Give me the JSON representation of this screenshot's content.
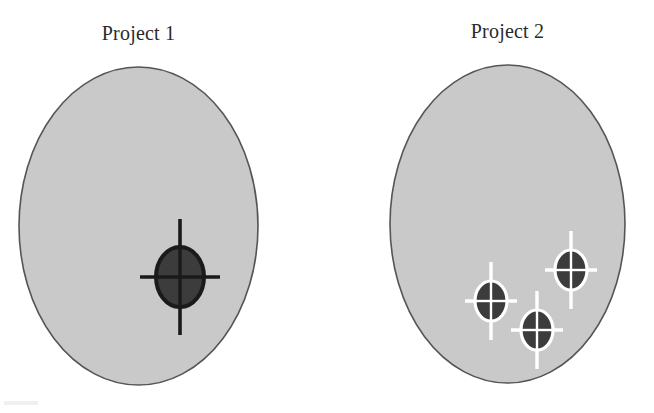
{
  "figure": {
    "caption_colors": {
      "background": "#ffffff",
      "ellipse_fill": "#c9c9c9",
      "ellipse_stroke": "#555555",
      "marker_fill": "#3c3c3c",
      "marker_stroke_dark": "#1a1a1a",
      "marker_stroke_light": "#ffffff",
      "title_text": "#2a2a2a"
    }
  },
  "panels": [
    {
      "id": "project-1",
      "title": "Project 1",
      "ellipse": {
        "cx": 138.5,
        "cy": 226,
        "rx": 119.5,
        "ry": 159
      },
      "marker_style": "dark-crosshair",
      "markers": [
        {
          "cx": 180,
          "cy": 277,
          "rx": 24,
          "ry": 30,
          "arm_h": 40,
          "arm_v": 58
        }
      ]
    },
    {
      "id": "project-2",
      "title": "Project 2",
      "ellipse": {
        "cx": 507.5,
        "cy": 224,
        "rx": 117.5,
        "ry": 159
      },
      "marker_style": "light-crosshair",
      "markers": [
        {
          "cx": 491,
          "cy": 301,
          "rx": 16,
          "ry": 20,
          "arm_h": 26,
          "arm_v": 39
        },
        {
          "cx": 571,
          "cy": 270,
          "rx": 16,
          "ry": 20,
          "arm_h": 26,
          "arm_v": 39
        },
        {
          "cx": 537,
          "cy": 330,
          "rx": 16,
          "ry": 20,
          "arm_h": 26,
          "arm_v": 39
        }
      ]
    }
  ],
  "chart_data": {
    "type": "scatter",
    "title": "",
    "xlabel": "",
    "ylabel": "",
    "grid": false,
    "legend": "none",
    "panels": [
      {
        "name": "Project 1",
        "target_region": {
          "center_x": 138.5,
          "center_y": 226
        },
        "points": [
          {
            "x": 180,
            "y": 277
          }
        ],
        "point_count": 1
      },
      {
        "name": "Project 2",
        "target_region": {
          "center_x": 507.5,
          "center_y": 224
        },
        "points": [
          {
            "x": 491,
            "y": 301
          },
          {
            "x": 571,
            "y": 270
          },
          {
            "x": 537,
            "y": 330
          }
        ],
        "point_count": 3
      }
    ]
  }
}
